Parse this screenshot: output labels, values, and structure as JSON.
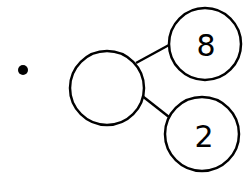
{
  "diagram": {
    "type": "number-bond",
    "whole": "",
    "parts": [
      "8",
      "2"
    ],
    "bullet": true,
    "colors": {
      "stroke": "#000000",
      "background": "#ffffff"
    }
  }
}
